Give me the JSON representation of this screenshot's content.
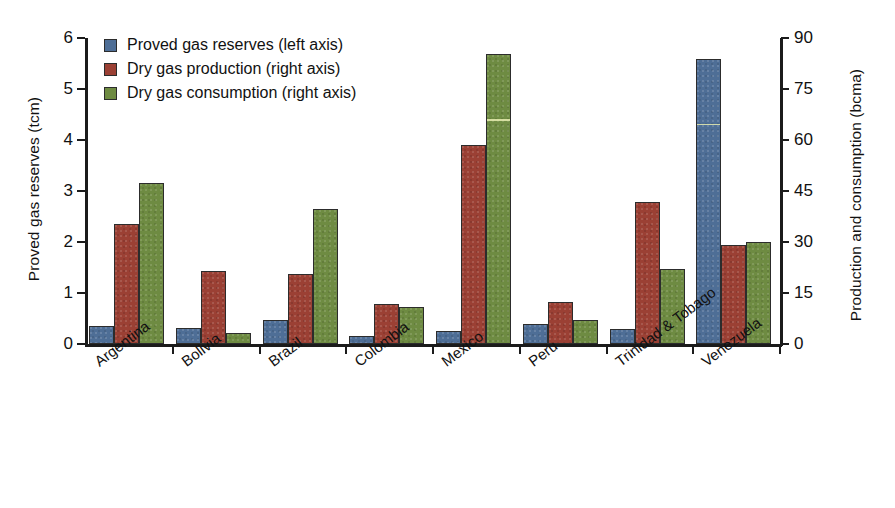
{
  "chart_data": {
    "type": "bar",
    "title": "",
    "subtitle": "",
    "categories": [
      "Argentina",
      "Bolivia",
      "Brazil",
      "Colombia",
      "Mexico",
      "Peru",
      "Trinidad & Tobago",
      "Venezuela"
    ],
    "series": [
      {
        "name": "Proved gas reserves (left axis)",
        "axis": "left",
        "unit": "tcm",
        "color": "#4e6e96",
        "values": [
          0.36,
          0.31,
          0.47,
          0.16,
          0.26,
          0.4,
          0.3,
          5.58
        ]
      },
      {
        "name": "Dry gas production (right axis)",
        "axis": "right",
        "unit": "bcma",
        "color": "#9b4034",
        "values": [
          35.4,
          21.4,
          20.7,
          11.7,
          58.6,
          12.5,
          41.8,
          29.1
        ]
      },
      {
        "name": "Dry gas consumption  (right axis)",
        "axis": "right",
        "unit": "bcma",
        "color": "#6e8b42",
        "values": [
          47.5,
          3.3,
          39.8,
          10.9,
          85.4,
          7.1,
          22.0,
          30.0
        ]
      }
    ],
    "left_axis": {
      "label": "Proved gas reserves (tcm)",
      "ticks": [
        "0",
        "1",
        "2",
        "3",
        "4",
        "5",
        "6"
      ],
      "tick_values": [
        0,
        1,
        2,
        3,
        4,
        5,
        6
      ],
      "lim": [
        0,
        6
      ]
    },
    "right_axis": {
      "label": "Production and consumption (bcma)",
      "ticks": [
        "0",
        "15",
        "30",
        "45",
        "60",
        "75",
        "90"
      ],
      "tick_values": [
        0,
        15,
        30,
        45,
        60,
        75,
        90
      ],
      "lim": [
        0,
        90
      ]
    },
    "legend": {
      "position": "top-left",
      "entries": [
        "Proved gas reserves (left axis)",
        "Dry gas production (right axis)",
        "Dry gas consumption  (right axis)"
      ]
    },
    "grid": false
  }
}
